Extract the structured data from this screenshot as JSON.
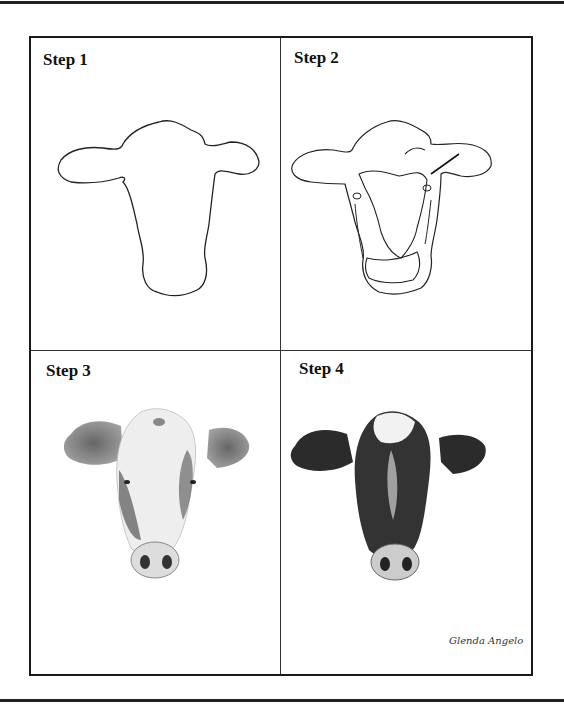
{
  "document": {
    "title": "How to draw a cow head - 4 steps",
    "steps": [
      {
        "label": "Step 1",
        "description": "Head and ear outline"
      },
      {
        "label": "Step 2",
        "description": "Contour lines for markings, eyes and muzzle"
      },
      {
        "label": "Step 3",
        "description": "Light pencil shading"
      },
      {
        "label": "Step 4",
        "description": "Dark finished shading"
      }
    ],
    "signature": "Glenda Angelo"
  },
  "colors": {
    "ink": "#1a1a1a",
    "paper": "#ffffff",
    "shade_dark": "#2b2b2b",
    "shade_mid": "#777777"
  }
}
